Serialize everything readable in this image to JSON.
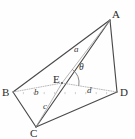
{
  "figure": {
    "kind": "geometry-diagram",
    "width": 135,
    "height": 139,
    "background_color": "#fefefe",
    "edge_color": "#4a4a4a",
    "construction_color": "#9a9a9a",
    "dotted_color": "#aaaaaa",
    "text_color": "#2b2b2b"
  },
  "vertices": [
    {
      "name": "A",
      "label": "A",
      "x": 110,
      "y": 20,
      "label_x": 112,
      "label_y": 9
    },
    {
      "name": "B",
      "label": "B",
      "x": 13,
      "y": 92,
      "label_x": 2,
      "label_y": 87
    },
    {
      "name": "C",
      "label": "C",
      "x": 36,
      "y": 127,
      "label_x": 30,
      "label_y": 128
    },
    {
      "name": "D",
      "label": "D",
      "x": 117,
      "y": 92,
      "label_x": 120,
      "label_y": 87
    },
    {
      "name": "E",
      "label": "E",
      "x": 62,
      "y": 83,
      "label_x": 53,
      "label_y": 74
    }
  ],
  "solid_edges": [
    {
      "name": "edge-AB",
      "from": "A",
      "to": "B"
    },
    {
      "name": "edge-AD",
      "from": "A",
      "to": "D"
    },
    {
      "name": "edge-AC",
      "from": "A",
      "to": "C"
    },
    {
      "name": "edge-BC",
      "from": "B",
      "to": "C"
    },
    {
      "name": "edge-CD",
      "from": "C",
      "to": "D"
    }
  ],
  "construction_lines": [
    {
      "name": "segment-EA",
      "from": "E",
      "to": "A"
    },
    {
      "name": "segment-EC",
      "from": "E",
      "to": "C"
    }
  ],
  "dotted_segments": [
    {
      "name": "segment-BE",
      "from": "B",
      "to": "E"
    },
    {
      "name": "segment-ED",
      "from": "E",
      "to": "D"
    }
  ],
  "segment_labels": [
    {
      "name": "label-a",
      "text": "a",
      "for": "segment-EA",
      "x": 74,
      "y": 45
    },
    {
      "name": "label-b",
      "text": "b",
      "for": "segment-BE",
      "x": 34,
      "y": 88
    },
    {
      "name": "label-c",
      "text": "c",
      "for": "segment-EC",
      "x": 43,
      "y": 102
    },
    {
      "name": "label-d",
      "text": "d",
      "for": "segment-ED",
      "x": 87,
      "y": 86
    }
  ],
  "angles": [
    {
      "name": "angle-theta",
      "text": "θ",
      "at": "E",
      "between": [
        "segment-EA",
        "segment-ED"
      ],
      "label_x": 79,
      "label_y": 63,
      "arc_radius": 17
    }
  ]
}
